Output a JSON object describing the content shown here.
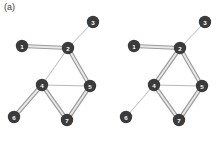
{
  "figure": {
    "panel_label": "(a)",
    "background_color": "#ffffff",
    "node_color": "#3b3b3b",
    "node_label_color": "#ffffff",
    "thin_edge_color": "#b8b8b8",
    "thick_edge_color": "#9a9a9a",
    "thick_edge_core_color": "#e9e9e9",
    "node_radius": 6.2
  },
  "graphs": [
    {
      "id": "graph-left",
      "name": "left-graph",
      "nodes": [
        {
          "id": "1",
          "label": "1",
          "x": 22,
          "y": 46
        },
        {
          "id": "2",
          "label": "2",
          "x": 68,
          "y": 48
        },
        {
          "id": "3",
          "label": "3",
          "x": 93,
          "y": 22
        },
        {
          "id": "4",
          "label": "4",
          "x": 42,
          "y": 85
        },
        {
          "id": "5",
          "label": "5",
          "x": 90,
          "y": 86
        },
        {
          "id": "6",
          "label": "6",
          "x": 14,
          "y": 117
        },
        {
          "id": "7",
          "label": "7",
          "x": 67,
          "y": 120
        }
      ],
      "edges": [
        {
          "from": "1",
          "to": "2",
          "style": "thick"
        },
        {
          "from": "2",
          "to": "3",
          "style": "thin"
        },
        {
          "from": "2",
          "to": "4",
          "style": "thin"
        },
        {
          "from": "2",
          "to": "5",
          "style": "thick"
        },
        {
          "from": "4",
          "to": "5",
          "style": "thin"
        },
        {
          "from": "4",
          "to": "6",
          "style": "thick"
        },
        {
          "from": "4",
          "to": "7",
          "style": "thick"
        },
        {
          "from": "5",
          "to": "7",
          "style": "thick"
        }
      ]
    },
    {
      "id": "graph-right",
      "name": "right-graph",
      "nodes": [
        {
          "id": "1",
          "label": "1",
          "x": 134,
          "y": 46
        },
        {
          "id": "2",
          "label": "2",
          "x": 180,
          "y": 48
        },
        {
          "id": "3",
          "label": "3",
          "x": 205,
          "y": 22
        },
        {
          "id": "4",
          "label": "4",
          "x": 154,
          "y": 85
        },
        {
          "id": "5",
          "label": "5",
          "x": 202,
          "y": 86
        },
        {
          "id": "6",
          "label": "6",
          "x": 126,
          "y": 117
        },
        {
          "id": "7",
          "label": "7",
          "x": 179,
          "y": 120
        }
      ],
      "edges": [
        {
          "from": "1",
          "to": "2",
          "style": "thick"
        },
        {
          "from": "2",
          "to": "3",
          "style": "thin"
        },
        {
          "from": "2",
          "to": "4",
          "style": "thick"
        },
        {
          "from": "2",
          "to": "5",
          "style": "thick"
        },
        {
          "from": "4",
          "to": "5",
          "style": "thin"
        },
        {
          "from": "4",
          "to": "6",
          "style": "thin"
        },
        {
          "from": "4",
          "to": "7",
          "style": "thick"
        },
        {
          "from": "5",
          "to": "7",
          "style": "thick"
        }
      ]
    }
  ]
}
